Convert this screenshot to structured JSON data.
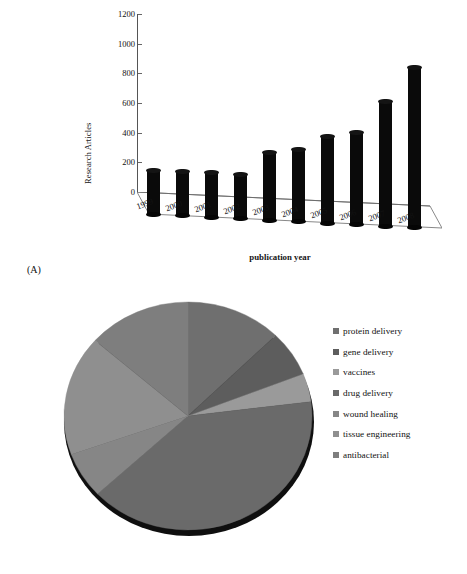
{
  "figure": {
    "panel_a_caption": "(A)",
    "panel_b_caption": "(B)"
  },
  "chart_data": [
    {
      "type": "bar",
      "title": "",
      "xlabel": "publication year",
      "ylabel": "Research Articles",
      "categories": [
        "1999",
        "2000",
        "2001",
        "2002",
        "2003",
        "2004",
        "2005",
        "2006",
        "2007",
        "2008"
      ],
      "values": [
        290,
        295,
        295,
        292,
        450,
        480,
        580,
        615,
        835,
        1070
      ],
      "ylim": [
        0,
        1200
      ],
      "yticks": [
        0,
        200,
        400,
        600,
        800,
        1000,
        1200
      ],
      "ytick_labels": [
        "0",
        "200",
        "400",
        "600",
        "800",
        "1000",
        "1200"
      ],
      "grid": false,
      "legend": "none",
      "style": "3d-cylinder-bars",
      "bar_color": "#0a0a0a"
    },
    {
      "type": "pie",
      "title": "",
      "labels": [
        "protein delivery",
        "gene delivery",
        "vaccines",
        "drug delivery",
        "wound healing",
        "tissue engineering",
        "antibacterial"
      ],
      "values": [
        12.5,
        6.5,
        4.0,
        40.0,
        6.5,
        17.0,
        13.5
      ],
      "colors": [
        "#6f6f6f",
        "#5d5d5d",
        "#9a9a9a",
        "#6a6a6a",
        "#868686",
        "#8f8f8f",
        "#7e7e7e"
      ],
      "start_angle": 0,
      "direction": "clockwise",
      "legend": "right",
      "grid": false
    }
  ],
  "legend_items": [
    {
      "label": "protein delivery",
      "color": "#6f6f6f"
    },
    {
      "label": "gene delivery",
      "color": "#5d5d5d"
    },
    {
      "label": "vaccines",
      "color": "#9a9a9a"
    },
    {
      "label": "drug delivery",
      "color": "#6a6a6a"
    },
    {
      "label": "wound healing",
      "color": "#868686"
    },
    {
      "label": "tissue engineering",
      "color": "#8f8f8f"
    },
    {
      "label": "antibacterial",
      "color": "#7e7e7e"
    }
  ]
}
